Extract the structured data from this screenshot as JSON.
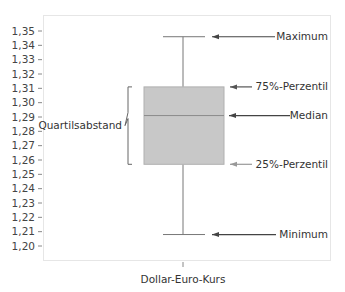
{
  "chart_data": {
    "type": "boxplot",
    "title": "",
    "xlabel": "Dollar-Euro-Kurs",
    "ylabel": "",
    "categories": [
      "Dollar-Euro-Kurs"
    ],
    "ylim": [
      1.2,
      1.35
    ],
    "yticks": [
      "1,35",
      "1,34",
      "1,33",
      "1,32",
      "1,31",
      "1,30",
      "1,29",
      "1,28",
      "1,27",
      "1,26",
      "1,25",
      "1,24",
      "1,23",
      "1,22",
      "1,21",
      "1,20"
    ],
    "grid": false,
    "box": {
      "minimum": 1.208,
      "q1": 1.257,
      "median": 1.291,
      "q3": 1.311,
      "maximum": 1.346
    },
    "annotations": [
      {
        "label": "Maximum",
        "target": "maximum"
      },
      {
        "label": "75%-Perzentil",
        "target": "q3"
      },
      {
        "label": "Median",
        "target": "median"
      },
      {
        "label": "25%-Perzentil",
        "target": "q1"
      },
      {
        "label": "Minimum",
        "target": "minimum"
      },
      {
        "label": "Quartilsabstand",
        "target": "iqr"
      }
    ],
    "colors": {
      "box_fill": "#c8c8c8",
      "box_stroke": "#b0b0b0",
      "whisker": "#777777",
      "median_line": "#8a8a8a",
      "arrow": "#555555",
      "frame": "#e6e6e6"
    }
  }
}
